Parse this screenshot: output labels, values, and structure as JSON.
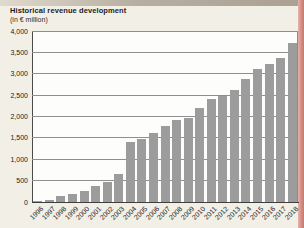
{
  "page": {
    "title": "Historical revenue development",
    "subtitle": "(in € million)"
  },
  "chart_data": {
    "type": "bar",
    "title": "Historical revenue development",
    "subtitle": "(in € million)",
    "categories": [
      "1996",
      "1997",
      "1998",
      "1999",
      "2000",
      "2001",
      "2002",
      "2003",
      "2004",
      "2005",
      "2006",
      "2007",
      "2008",
      "2009",
      "2010",
      "2011",
      "2012",
      "2013",
      "2014",
      "2015",
      "2016",
      "2017",
      "2018"
    ],
    "values": [
      30,
      40,
      140,
      180,
      250,
      370,
      460,
      660,
      1400,
      1470,
      1620,
      1770,
      1910,
      1970,
      2190,
      2400,
      2480,
      2610,
      2870,
      3120,
      3230,
      3380,
      3720
    ],
    "ylim": [
      0,
      4000
    ],
    "ytick_step": 500,
    "ytick_labels": [
      "0",
      "500",
      "1,000",
      "1,500",
      "2,000",
      "2,500",
      "3,000",
      "3,500",
      "4,000"
    ],
    "grid": true,
    "legend": "none",
    "bar_color": "#9c9c9c",
    "plot_bg": "#fdfdfc",
    "page_bg": "#f2efe7",
    "gridline_color": "#8f8f8f"
  }
}
